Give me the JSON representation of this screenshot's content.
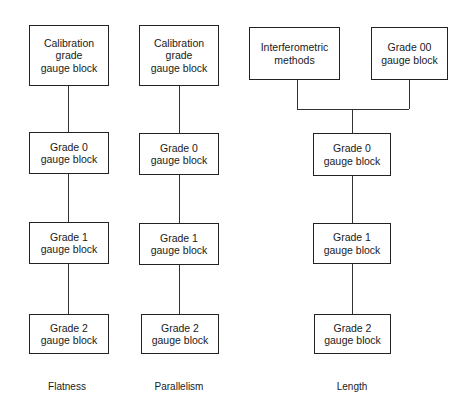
{
  "diagram": {
    "columns": [
      {
        "caption": "Flatness",
        "boxes": [
          {
            "label": "Calibration\ngrade\ngauge block"
          },
          {
            "label": "Grade 0\ngauge block"
          },
          {
            "label": "Grade 1\ngauge block"
          },
          {
            "label": "Grade 2\ngauge block"
          }
        ]
      },
      {
        "caption": "Parallelism",
        "boxes": [
          {
            "label": "Calibration\ngrade\ngauge block"
          },
          {
            "label": "Grade 0\ngauge block"
          },
          {
            "label": "Grade 1\ngauge block"
          },
          {
            "label": "Grade 2\ngauge block"
          }
        ]
      },
      {
        "caption": "Length",
        "top_sources": [
          {
            "label": "Interferometric\nmethods"
          },
          {
            "label": "Grade 00\ngauge block"
          }
        ],
        "boxes": [
          {
            "label": "Grade 0\ngauge block"
          },
          {
            "label": "Grade 1\ngauge block"
          },
          {
            "label": "Grade 2\ngauge block"
          }
        ]
      }
    ],
    "colors": {
      "line": "#333333",
      "border": "#222222",
      "text": "#1a1a1a",
      "background": "#ffffff"
    }
  }
}
